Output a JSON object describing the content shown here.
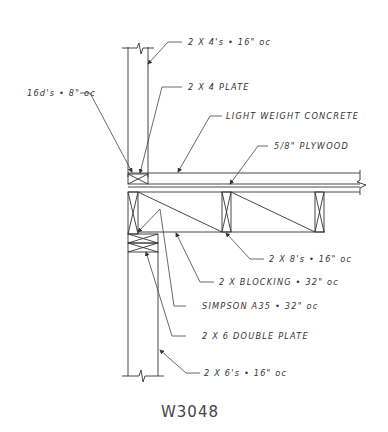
{
  "drawing": {
    "title": "W3048",
    "labels": {
      "studs_upper": "2 X 4's • 16\" oc",
      "nails": "16d's • 8\" oc",
      "plate_2x4": "2 X 4 PLATE",
      "concrete": "LIGHT WEIGHT CONCRETE",
      "plywood": "5/8\" PLYWOOD",
      "joists": "2 X 8's • 16\" oc",
      "blocking": "2 X BLOCKING • 32\" oc",
      "simpson": "SIMPSON A35 • 32\" oc",
      "double_plate": "2 X 6 DOUBLE PLATE",
      "studs_lower": "2 X 6's • 16\" oc"
    }
  }
}
